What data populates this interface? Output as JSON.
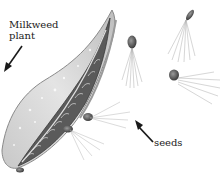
{
  "figure": {
    "labels": {
      "plant_line1": "Milkweed",
      "plant_line2": "plant",
      "seeds": "seeds"
    },
    "colors": {
      "background": "#ffffff",
      "ink": "#1a1a1a",
      "pod_light": "#d9d9d9",
      "pod_mid": "#a8a8a8",
      "pod_dark": "#4a4a4a",
      "fluff": "#9a9a9a"
    }
  }
}
